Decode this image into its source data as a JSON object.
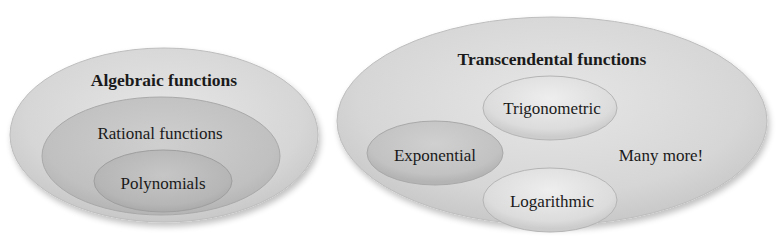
{
  "diagram": {
    "type": "nested-ellipse-venn",
    "groups": [
      {
        "title": "Algebraic functions",
        "nested": [
          {
            "label": "Rational functions"
          },
          {
            "label": "Polynomials"
          }
        ]
      },
      {
        "title": "Transcendental functions",
        "members": [
          {
            "label": "Trigonometric"
          },
          {
            "label": "Exponential"
          },
          {
            "label": "Logarithmic"
          }
        ],
        "note": "Many more!"
      }
    ]
  },
  "colors": {
    "outer_fill": "#d8d8d8",
    "middle_fill": "#c4c4c4",
    "inner_fill": "#b8b8b8",
    "text": "#1a1a1a",
    "background": "#ffffff"
  }
}
